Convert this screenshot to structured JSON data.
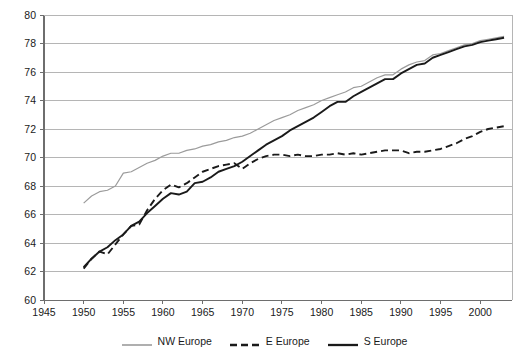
{
  "chart_data": {
    "type": "line",
    "title": "",
    "subtitle": "",
    "xlabel": "",
    "ylabel": "",
    "xlim": [
      1945,
      2004
    ],
    "ylim": [
      60,
      80
    ],
    "ytick_step": 2,
    "xtick_step": 5,
    "grid": "horizontal",
    "legend_position": "bottom-center",
    "xticks": [
      "1945",
      "1950",
      "1955",
      "1960",
      "1965",
      "1970",
      "1975",
      "1980",
      "1985",
      "1990",
      "1995",
      "2000"
    ],
    "xtick_values": [
      1945,
      1950,
      1955,
      1960,
      1965,
      1970,
      1975,
      1980,
      1985,
      1990,
      1995,
      2000
    ],
    "yticks": [
      "60",
      "62",
      "64",
      "66",
      "68",
      "70",
      "72",
      "74",
      "76",
      "78",
      "80"
    ],
    "ytick_values": [
      60,
      62,
      64,
      66,
      68,
      70,
      72,
      74,
      76,
      78,
      80
    ],
    "series": [
      {
        "name": "NW Europe",
        "color": "#9b9b9b",
        "style": "solid",
        "width": 1.2,
        "x": [
          1950,
          1951,
          1952,
          1953,
          1954,
          1955,
          1956,
          1957,
          1958,
          1959,
          1960,
          1961,
          1962,
          1963,
          1964,
          1965,
          1966,
          1967,
          1968,
          1969,
          1970,
          1971,
          1972,
          1973,
          1974,
          1975,
          1976,
          1977,
          1978,
          1979,
          1980,
          1981,
          1982,
          1983,
          1984,
          1985,
          1986,
          1987,
          1988,
          1989,
          1990,
          1991,
          1992,
          1993,
          1994,
          1995,
          1996,
          1997,
          1998,
          1999,
          2000,
          2001,
          2002,
          2003
        ],
        "y": [
          66.8,
          67.3,
          67.6,
          67.7,
          68.0,
          68.9,
          69.0,
          69.3,
          69.6,
          69.8,
          70.1,
          70.3,
          70.3,
          70.5,
          70.6,
          70.8,
          70.9,
          71.1,
          71.2,
          71.4,
          71.5,
          71.7,
          72.0,
          72.3,
          72.6,
          72.8,
          73.0,
          73.3,
          73.5,
          73.7,
          74.0,
          74.2,
          74.4,
          74.6,
          74.9,
          75.0,
          75.3,
          75.6,
          75.8,
          75.8,
          76.2,
          76.5,
          76.7,
          76.8,
          77.2,
          77.3,
          77.5,
          77.7,
          77.9,
          78.0,
          78.2,
          78.3,
          78.4,
          78.5
        ]
      },
      {
        "name": "E Europe",
        "color": "#1a1a1a",
        "style": "dashed",
        "width": 1.9,
        "x": [
          1950,
          1951,
          1952,
          1953,
          1954,
          1955,
          1956,
          1957,
          1958,
          1959,
          1960,
          1961,
          1962,
          1963,
          1964,
          1965,
          1966,
          1967,
          1968,
          1969,
          1970,
          1971,
          1972,
          1973,
          1974,
          1975,
          1976,
          1977,
          1978,
          1979,
          1980,
          1981,
          1982,
          1983,
          1984,
          1985,
          1986,
          1987,
          1988,
          1989,
          1990,
          1991,
          1992,
          1993,
          1994,
          1995,
          1996,
          1997,
          1998,
          1999,
          2000,
          2001,
          2002,
          2003
        ],
        "y": [
          62.2,
          62.9,
          63.4,
          63.2,
          63.9,
          64.6,
          65.2,
          65.3,
          66.3,
          67.1,
          67.7,
          68.1,
          67.9,
          68.2,
          68.6,
          69.0,
          69.2,
          69.4,
          69.5,
          69.6,
          69.2,
          69.6,
          69.9,
          70.1,
          70.2,
          70.2,
          70.1,
          70.2,
          70.1,
          70.1,
          70.2,
          70.2,
          70.3,
          70.2,
          70.3,
          70.2,
          70.3,
          70.4,
          70.5,
          70.5,
          70.5,
          70.3,
          70.4,
          70.4,
          70.5,
          70.6,
          70.8,
          71.0,
          71.3,
          71.5,
          71.8,
          72.0,
          72.1,
          72.2
        ]
      },
      {
        "name": "S Europe",
        "color": "#1a1a1a",
        "style": "solid",
        "width": 1.9,
        "x": [
          1950,
          1951,
          1952,
          1953,
          1954,
          1955,
          1956,
          1957,
          1958,
          1959,
          1960,
          1961,
          1962,
          1963,
          1964,
          1965,
          1966,
          1967,
          1968,
          1969,
          1970,
          1971,
          1972,
          1973,
          1974,
          1975,
          1976,
          1977,
          1978,
          1979,
          1980,
          1981,
          1982,
          1983,
          1984,
          1985,
          1986,
          1987,
          1988,
          1989,
          1990,
          1991,
          1992,
          1993,
          1994,
          1995,
          1996,
          1997,
          1998,
          1999,
          2000,
          2001,
          2002,
          2003
        ],
        "y": [
          62.3,
          62.9,
          63.4,
          63.7,
          64.2,
          64.6,
          65.2,
          65.5,
          66.1,
          66.6,
          67.1,
          67.5,
          67.4,
          67.6,
          68.2,
          68.3,
          68.6,
          69.0,
          69.2,
          69.4,
          69.7,
          70.1,
          70.5,
          70.9,
          71.2,
          71.5,
          71.9,
          72.2,
          72.5,
          72.8,
          73.2,
          73.6,
          73.9,
          73.9,
          74.3,
          74.6,
          74.9,
          75.2,
          75.5,
          75.5,
          75.9,
          76.2,
          76.5,
          76.6,
          77.0,
          77.2,
          77.4,
          77.6,
          77.8,
          77.9,
          78.1,
          78.2,
          78.3,
          78.4
        ]
      }
    ]
  },
  "legend": {
    "items": [
      {
        "label": "NW Europe"
      },
      {
        "label": "E Europe"
      },
      {
        "label": "S Europe"
      }
    ]
  },
  "axes": {
    "y_labels": [
      "80",
      "78",
      "76",
      "74",
      "72",
      "70",
      "68",
      "66",
      "64",
      "62",
      "60"
    ],
    "x_labels": [
      "1945",
      "1950",
      "1955",
      "1960",
      "1965",
      "1970",
      "1975",
      "1980",
      "1985",
      "1990",
      "1995",
      "2000"
    ]
  },
  "colors": {
    "nw_europe": "#9b9b9b",
    "e_europe": "#1a1a1a",
    "s_europe": "#1a1a1a",
    "grid": "#b5b5b5",
    "axis": "#6e6e6e",
    "background": "#ffffff"
  }
}
